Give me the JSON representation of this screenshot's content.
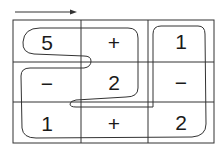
{
  "diagram": {
    "type": "grid-path-puzzle",
    "direction_arrow": "right-arrow",
    "grid": {
      "rows": 3,
      "cols": 3,
      "cells": [
        [
          "5",
          "+",
          "1"
        ],
        [
          "−",
          "2",
          "−"
        ],
        [
          "1",
          "+",
          "2"
        ]
      ]
    },
    "colors": {
      "line": "#333333",
      "text": "#1a1a1a",
      "background": "#ffffff"
    }
  }
}
